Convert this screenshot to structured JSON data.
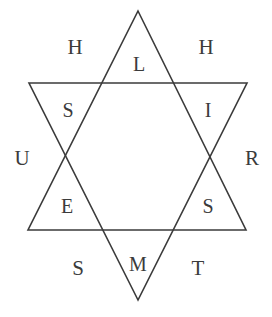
{
  "figure": {
    "shape": "six-pointed-star",
    "stroke_color": "#3b3b3b",
    "background_color": "#ffffff",
    "text_color": "#3b3b3b",
    "width": 272,
    "height": 317
  },
  "geometry": {
    "upward_triangle": {
      "name": "upward-triangle",
      "points": "138,11 246,230 28,230"
    },
    "downward_triangle": {
      "name": "downward-triangle",
      "points": "138,300 29,83 247,83"
    }
  },
  "inner_letters": [
    {
      "label": "L",
      "position": "top-point",
      "x": 139,
      "y": 64
    },
    {
      "label": "I",
      "position": "upper-right-point",
      "x": 208,
      "y": 110
    },
    {
      "label": "S",
      "position": "lower-right-point",
      "x": 208,
      "y": 206
    },
    {
      "label": "M",
      "position": "bottom-point",
      "x": 138,
      "y": 264
    },
    {
      "label": "E",
      "position": "lower-left-point",
      "x": 67,
      "y": 206
    },
    {
      "label": "S",
      "position": "upper-left-point",
      "x": 68,
      "y": 110
    }
  ],
  "outer_letters": [
    {
      "label": "H",
      "position": "top-left-notch",
      "x": 75,
      "y": 47
    },
    {
      "label": "H",
      "position": "top-right-notch",
      "x": 206,
      "y": 47
    },
    {
      "label": "R",
      "position": "right-notch",
      "x": 252,
      "y": 158
    },
    {
      "label": "T",
      "position": "bottom-right-notch",
      "x": 198,
      "y": 268
    },
    {
      "label": "S",
      "position": "bottom-left-notch",
      "x": 78,
      "y": 268
    },
    {
      "label": "U",
      "position": "left-notch",
      "x": 22,
      "y": 158
    }
  ]
}
